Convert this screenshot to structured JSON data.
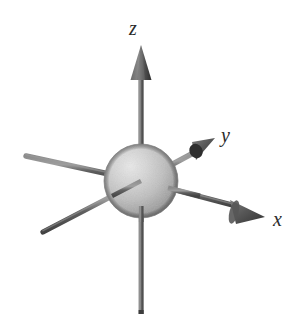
{
  "figure": {
    "name": "three-dimensional-cartesian-axes-with-sphere",
    "width": 305,
    "height": 324,
    "background_color": "#ffffff"
  },
  "labels": {
    "z": "z",
    "y": "y",
    "x": "x"
  },
  "colors": {
    "axis_shaft": "#6e6e6e",
    "axis_shaft_dark": "#4a4a4a",
    "arrowhead": "#4f4f4f",
    "arrowhead_dark": "#3a3a3a",
    "sphere_highlight": "#e2e2e2",
    "sphere_mid": "#bdbdbd",
    "sphere_shadow": "#8d8d8d",
    "sphere_edge": "#7a7a7a",
    "label_color": "#2b2b2b"
  },
  "geometry": {
    "origin": {
      "x": 141,
      "y": 181
    },
    "sphere_radius": 37,
    "axes": [
      {
        "name": "z-axis",
        "positive_tip": {
          "x": 141,
          "y": 46
        },
        "negative_tip": {
          "x": 141,
          "y": 314
        },
        "has_arrowhead": true
      },
      {
        "name": "y-axis",
        "positive_tip": {
          "x": 214,
          "y": 139
        },
        "negative_tip": {
          "x": 25,
          "y": 156
        },
        "has_arrowhead": true
      },
      {
        "name": "x-axis",
        "positive_tip": {
          "x": 265,
          "y": 217
        },
        "negative_tip": {
          "x": 42,
          "y": 233
        },
        "has_arrowhead": true
      }
    ]
  }
}
